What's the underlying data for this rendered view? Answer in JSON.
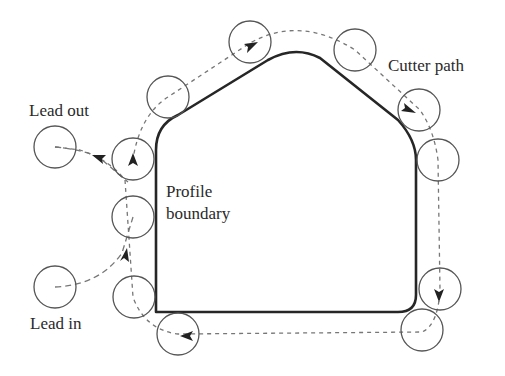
{
  "labels": {
    "lead_out": "Lead out",
    "cutter_path": "Cutter path",
    "profile_boundary_line1": "Profile",
    "profile_boundary_line2": "boundary",
    "lead_in": "Lead in"
  },
  "colors": {
    "boundary": "#262626",
    "circle": "#555555",
    "path": "#777777",
    "arrow": "#222222",
    "text": "#2a2a2a"
  }
}
